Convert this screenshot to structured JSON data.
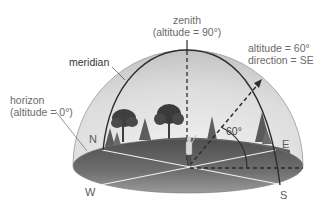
{
  "figure": {
    "type": "celestial sphere diagram",
    "labels": {
      "zenith_title": "zenith",
      "zenith_sub": "(altitude = 90°)",
      "meridian": "meridian",
      "horizon_title": "horizon",
      "horizon_sub": "(altitude = 0°)",
      "star_altitude": "altitude = 60°",
      "star_direction": "direction = SE",
      "angle": "60°"
    },
    "directions": {
      "north": "N",
      "east": "E",
      "west": "W",
      "south": "S"
    },
    "colors": {
      "dome_edge": "#c9c9c9",
      "dome_inner": "#e4e4e4",
      "ground_dark": "#5c5c5c",
      "ground_light": "#8a8a8a",
      "line": "#333333",
      "text": "#6a6a6a"
    }
  }
}
